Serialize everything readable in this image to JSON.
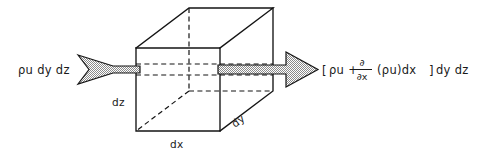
{
  "figure": {
    "background_color": "#ffffff",
    "line_color": "#141414",
    "fill_pattern_color": "#8c8c8c",
    "width": 484,
    "height": 154
  },
  "labels": {
    "inflow": "ρu dy dz",
    "outflow_open_bracket": "[",
    "outflow_term1": "ρu +",
    "outflow_partial_numerator": "∂",
    "outflow_partial_denominator": "∂x",
    "outflow_term2": "(ρu)dx",
    "outflow_close_bracket": "]",
    "outflow_term3": "dy dz",
    "outflow_full": "[ρu + ∂/∂x (ρu)dx]dy dz",
    "dimension_z": "dz",
    "dimension_x": "dx",
    "dimension_y": "dy"
  },
  "icons": {
    "inflow_arrow": "swallowtail-arrow-right-icon",
    "outflow_arrow": "block-arrow-right-icon",
    "control_volume": "cube-icon"
  },
  "geometry": {
    "cube_front_left_x": 136,
    "cube_front_right_x": 220,
    "cube_front_top_y": 48,
    "cube_front_bottom_y": 131,
    "cube_back_offset_x": 53,
    "cube_back_offset_y": -40,
    "arrow_axis_y": 69
  }
}
